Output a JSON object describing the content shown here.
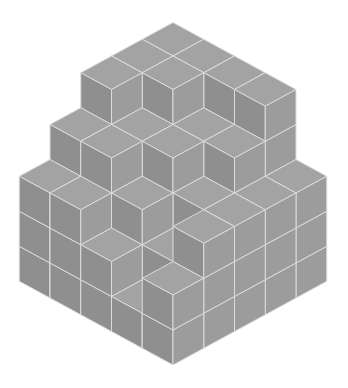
{
  "figure": {
    "grid_size": [
      5,
      5
    ],
    "heightmap": [
      [
        5,
        5,
        5,
        5,
        3
      ],
      [
        5,
        5,
        4,
        4,
        3
      ],
      [
        5,
        4,
        4,
        3,
        3
      ],
      [
        4,
        4,
        3,
        2,
        3
      ],
      [
        3,
        3,
        2,
        1,
        2
      ]
    ],
    "projection": {
      "origin": [
        173,
        197.5
      ],
      "x_step": [
        30.75,
        16.75
      ],
      "y_step": [
        -30.75,
        16.75
      ],
      "z_step": 35
    },
    "colors": {
      "top": "#a3a3a3",
      "left": "#8f8f8f",
      "right": "#9c9c9c",
      "edge": "#dcdcdc",
      "background": "#ffffff"
    }
  }
}
